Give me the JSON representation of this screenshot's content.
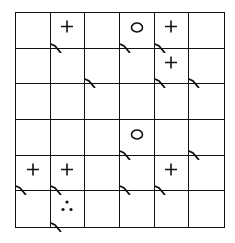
{
  "grid": {
    "rows": 6,
    "cols": 6,
    "cells": [
      [
        {
          "symbol": "",
          "corner": false
        },
        {
          "symbol": "plus",
          "corner": true
        },
        {
          "symbol": "",
          "corner": false
        },
        {
          "symbol": "circle",
          "corner": true
        },
        {
          "symbol": "plus",
          "corner": true
        },
        {
          "symbol": "",
          "corner": false
        }
      ],
      [
        {
          "symbol": "",
          "corner": false
        },
        {
          "symbol": "",
          "corner": false
        },
        {
          "symbol": "",
          "corner": true
        },
        {
          "symbol": "",
          "corner": false
        },
        {
          "symbol": "plus",
          "corner": true
        },
        {
          "symbol": "",
          "corner": true
        }
      ],
      [
        {
          "symbol": "",
          "corner": false
        },
        {
          "symbol": "",
          "corner": false
        },
        {
          "symbol": "",
          "corner": false
        },
        {
          "symbol": "",
          "corner": false
        },
        {
          "symbol": "",
          "corner": false
        },
        {
          "symbol": "",
          "corner": false
        }
      ],
      [
        {
          "symbol": "",
          "corner": false
        },
        {
          "symbol": "",
          "corner": false
        },
        {
          "symbol": "",
          "corner": false
        },
        {
          "symbol": "circle",
          "corner": true
        },
        {
          "symbol": "",
          "corner": false
        },
        {
          "symbol": "",
          "corner": true
        }
      ],
      [
        {
          "symbol": "plus",
          "corner": true
        },
        {
          "symbol": "plus",
          "corner": true
        },
        {
          "symbol": "",
          "corner": false
        },
        {
          "symbol": "",
          "corner": true
        },
        {
          "symbol": "plus",
          "corner": true
        },
        {
          "symbol": "",
          "corner": false
        }
      ],
      [
        {
          "symbol": "",
          "corner": false
        },
        {
          "symbol": "dots",
          "corner": true
        },
        {
          "symbol": "",
          "corner": false
        },
        {
          "symbol": "",
          "corner": false
        },
        {
          "symbol": "",
          "corner": false
        },
        {
          "symbol": "",
          "corner": false
        }
      ]
    ]
  },
  "colors": {
    "ink": "#111111",
    "background": "#ffffff"
  }
}
